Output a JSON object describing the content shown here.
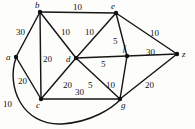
{
  "figure": {
    "name": "weighted-undirected-graph",
    "background_color": "#fdfdfc",
    "stroke_color": "#161616",
    "text_color": "#141414",
    "width": 195,
    "height": 129
  },
  "chart_data": {
    "type": "diagram",
    "subtype": "weighted-undirected-graph",
    "title": "",
    "xlabel": "",
    "ylabel": "",
    "grid": false,
    "legend": "none",
    "nodes": [
      {
        "id": "a",
        "label": "a",
        "x": 16,
        "y": 57,
        "label_x": 6,
        "label_y": 53
      },
      {
        "id": "b",
        "label": "b",
        "x": 40,
        "y": 12,
        "label_x": 35,
        "label_y": 1
      },
      {
        "id": "c",
        "label": "c",
        "x": 41,
        "y": 99,
        "label_x": 36,
        "label_y": 101
      },
      {
        "id": "d",
        "label": "d",
        "x": 76,
        "y": 58,
        "label_x": 66,
        "label_y": 55
      },
      {
        "id": "e",
        "label": "e",
        "x": 116,
        "y": 13,
        "label_x": 111,
        "label_y": 2
      },
      {
        "id": "f",
        "label": "f",
        "x": 127,
        "y": 56,
        "label_x": 123,
        "label_y": 44
      },
      {
        "id": "g",
        "label": "g",
        "x": 120,
        "y": 99,
        "label_x": 121,
        "label_y": 101
      },
      {
        "id": "z",
        "label": "z",
        "x": 177,
        "y": 54,
        "label_x": 182,
        "label_y": 50
      }
    ],
    "edges": [
      {
        "id": "a-b",
        "source": "a",
        "target": "b",
        "weight": 30,
        "label": "30",
        "label_x": 16,
        "label_y": 28,
        "curved": false
      },
      {
        "id": "a-c",
        "source": "a",
        "target": "c",
        "weight": 20,
        "label": "20",
        "label_x": 18,
        "label_y": 77,
        "curved": false
      },
      {
        "id": "a-g",
        "source": "a",
        "target": "g",
        "weight": 10,
        "label": "10",
        "label_x": 3,
        "label_y": 100,
        "curved": true
      },
      {
        "id": "b-e",
        "source": "b",
        "target": "e",
        "weight": 10,
        "label": "10",
        "label_x": 73,
        "label_y": 3,
        "curved": false
      },
      {
        "id": "b-c",
        "source": "b",
        "target": "c",
        "weight": 20,
        "label": "20",
        "label_x": 43,
        "label_y": 55,
        "curved": false
      },
      {
        "id": "b-d",
        "source": "b",
        "target": "d",
        "weight": 10,
        "label": "10",
        "label_x": 61,
        "label_y": 28,
        "curved": false
      },
      {
        "id": "c-d",
        "source": "c",
        "target": "d",
        "weight": 20,
        "label": "20",
        "label_x": 63,
        "label_y": 81,
        "curved": false
      },
      {
        "id": "c-g",
        "source": "c",
        "target": "g",
        "weight": 30,
        "label": "30",
        "label_x": 75,
        "label_y": 88,
        "curved": false
      },
      {
        "id": "d-e",
        "source": "d",
        "target": "e",
        "weight": 10,
        "label": "10",
        "label_x": 85,
        "label_y": 28,
        "curved": false
      },
      {
        "id": "d-f",
        "source": "d",
        "target": "f",
        "weight": 5,
        "label": "5",
        "label_x": 101,
        "label_y": 60,
        "curved": false
      },
      {
        "id": "d-g",
        "source": "d",
        "target": "g",
        "weight": 5,
        "label": "5",
        "label_x": 88,
        "label_y": 81,
        "curved": false
      },
      {
        "id": "e-f",
        "source": "e",
        "target": "f",
        "weight": 5,
        "label": "5",
        "label_x": 113,
        "label_y": 37,
        "curved": false
      },
      {
        "id": "e-z",
        "source": "e",
        "target": "z",
        "weight": 10,
        "label": "10",
        "label_x": 150,
        "label_y": 29,
        "curved": false
      },
      {
        "id": "f-g",
        "source": "f",
        "target": "g",
        "weight": 10,
        "label": "10",
        "label_x": 106,
        "label_y": 81,
        "curved": false
      },
      {
        "id": "f-z",
        "source": "f",
        "target": "z",
        "weight": 30,
        "label": "30",
        "label_x": 146,
        "label_y": 48,
        "curved": false
      },
      {
        "id": "g-z",
        "source": "g",
        "target": "z",
        "weight": 20,
        "label": "20",
        "label_x": 145,
        "label_y": 81,
        "curved": false
      }
    ],
    "curve_paths": {
      "a-g": "M 16,58 C 6,86 22,126 62,124 C 92,122 112,108 120,100"
    }
  }
}
